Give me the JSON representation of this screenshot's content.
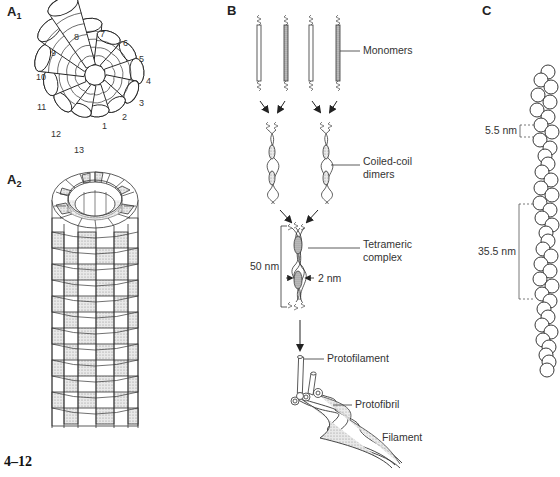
{
  "figure": {
    "number": "4–12",
    "panels": {
      "A1": {
        "label": "A",
        "sub": "1",
        "cone_numbers": [
          "1",
          "2",
          "3",
          "4",
          "5",
          "6",
          "7",
          "8",
          "9",
          "10",
          "11",
          "12",
          "13"
        ]
      },
      "A2": {
        "label": "A",
        "sub": "2"
      },
      "B": {
        "label": "B",
        "callouts": {
          "monomers": "Monomers",
          "coiled_coil_line1": "Coiled-coil",
          "coiled_coil_line2": "dimers",
          "tetrameric_line1": "Tetrameric",
          "tetrameric_line2": "complex",
          "length": "50 nm",
          "width": "2 nm",
          "protofilament": "Protofilament",
          "protofibril": "Protofibril",
          "filament": "Filament"
        }
      },
      "C": {
        "label": "C",
        "callouts": {
          "monomer_spacing": "5.5 nm",
          "half_repeat": "35.5 nm"
        }
      }
    }
  }
}
